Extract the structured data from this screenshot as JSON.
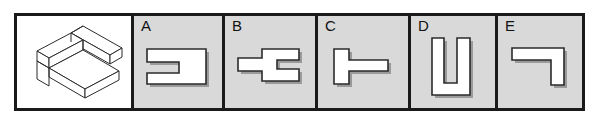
{
  "question": {
    "type": "spatial-reasoning-mental-rotation",
    "stem": {
      "label": "",
      "figure_name": "isometric-l-shaped-bar-solid",
      "description": "Three-dimensional isometric drawing of an L-shaped bar assembly with rectangular cross sections"
    },
    "background_colors": {
      "stem_cell": "#ffffff",
      "option_cell": "#d9d9d9",
      "page": "#ffffff",
      "shape_fill": "#ffffff",
      "outline": "#2b2b2b",
      "frame": "#1a1a1a",
      "drop_shadow": "#9a9a9a"
    },
    "options": [
      {
        "label": "A",
        "figure_name": "rectangle-with-left-slot-notch",
        "description": "Rectangle with a horizontal slot notch cut into the left edge"
      },
      {
        "label": "B",
        "figure_name": "double-stepped-cross-notch",
        "description": "Stepped cross-like outline with a notch cut into the right edge"
      },
      {
        "label": "C",
        "figure_name": "sideways-t-shape",
        "description": "T-shape rotated so the stem points to the right"
      },
      {
        "label": "D",
        "figure_name": "u-shape-upright",
        "description": "Upright U-shaped channel outline"
      },
      {
        "label": "E",
        "figure_name": "l-shape-corner",
        "description": "L-shaped corner bracket outline"
      }
    ]
  }
}
